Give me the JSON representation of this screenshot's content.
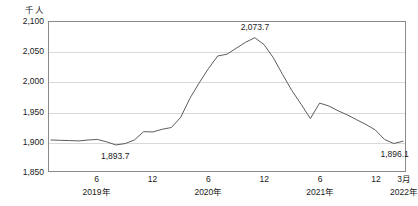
{
  "chart_data": {
    "type": "line",
    "title": "",
    "unit_label": "千人",
    "xlabel": "",
    "ylabel": "",
    "ylim": [
      1850,
      2100
    ],
    "yticks": [
      "1,850",
      "1,900",
      "1,950",
      "2,000",
      "2,050",
      "2,100"
    ],
    "ytick_values": [
      1850,
      1900,
      1950,
      2000,
      2050,
      2100
    ],
    "grid": true,
    "legend": "none",
    "line_color": "#5a5a5a",
    "grid_color": "#d9d9d9",
    "axis_color": "#8a8a8a",
    "xticks": [
      {
        "label": "6",
        "year": "2019年",
        "index": 5
      },
      {
        "label": "12",
        "year": "",
        "index": 11
      },
      {
        "label": "6",
        "year": "2020年",
        "index": 17
      },
      {
        "label": "12",
        "year": "",
        "index": 23
      },
      {
        "label": "6",
        "year": "2021年",
        "index": 29
      },
      {
        "label": "12",
        "year": "",
        "index": 35
      },
      {
        "label": "3月",
        "year": "2022年",
        "index": 38
      }
    ],
    "x": [
      "2019-01",
      "2019-02",
      "2019-03",
      "2019-04",
      "2019-05",
      "2019-06",
      "2019-07",
      "2019-08",
      "2019-09",
      "2019-10",
      "2019-11",
      "2019-12",
      "2020-01",
      "2020-02",
      "2020-03",
      "2020-04",
      "2020-05",
      "2020-06",
      "2020-07",
      "2020-08",
      "2020-09",
      "2020-10",
      "2020-11",
      "2020-12",
      "2021-01",
      "2021-02",
      "2021-03",
      "2021-04",
      "2021-05",
      "2021-06",
      "2021-07",
      "2021-08",
      "2021-09",
      "2021-10",
      "2021-11",
      "2021-12",
      "2022-01",
      "2022-02",
      "2022-03"
    ],
    "values": [
      1902.0,
      1901.5,
      1901.0,
      1900.5,
      1902.0,
      1903.0,
      1899.0,
      1893.7,
      1896.0,
      1902.0,
      1916.0,
      1915.5,
      1920.0,
      1923.0,
      1940.0,
      1972.0,
      1998.0,
      2022.0,
      2043.0,
      2046.0,
      2056.0,
      2066.0,
      2073.7,
      2062.0,
      2040.0,
      2012.0,
      1985.0,
      1962.0,
      1938.0,
      1964.0,
      1959.0,
      1951.0,
      1944.0,
      1936.0,
      1928.0,
      1919.0,
      1903.0,
      1896.1,
      1900.0
    ],
    "annotations": [
      {
        "label": "1,893.7",
        "index": 7,
        "value": 1893.7,
        "position": "below"
      },
      {
        "label": "2,073.7",
        "index": 22,
        "value": 2073.7,
        "position": "above"
      },
      {
        "label": "1,896.1",
        "index": 37,
        "value": 1896.1,
        "position": "below"
      }
    ]
  }
}
